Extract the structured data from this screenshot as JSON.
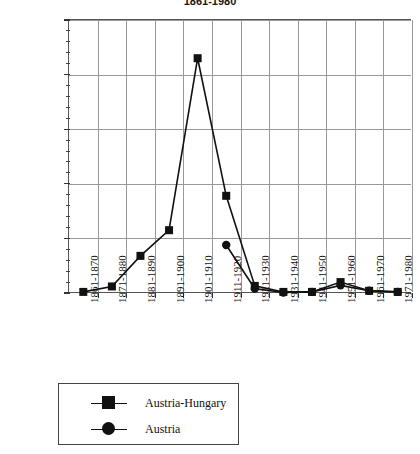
{
  "chart_data": {
    "type": "line",
    "title": "1861-1980",
    "xlabel": "",
    "ylabel": "",
    "ylim": [
      0,
      2500000
    ],
    "ytick_values": [
      0,
      500000,
      1000000,
      1500000,
      2000000,
      2500000
    ],
    "ytick_labels": [
      "0",
      "500,000",
      "1,000,000",
      "1,500,000",
      "2,000,000",
      "2,500,000"
    ],
    "yminor_step": 100000,
    "grid": true,
    "legend_position": "below",
    "categories": [
      "1861-1870",
      "1871-1880",
      "1881-1890",
      "1891-1900",
      "1901-1910",
      "1911-1920",
      "1921-1930",
      "1931-1940",
      "1941-1950",
      "1951-1960",
      "1961-1970",
      "1971-1980"
    ],
    "series": [
      {
        "name": "Austria-Hungary",
        "marker": "square",
        "color": "#111111",
        "values": [
          10000,
          60000,
          340000,
          575000,
          2150000,
          890000,
          65000,
          10000,
          10000,
          100000,
          20000,
          10000
        ]
      },
      {
        "name": "Austria",
        "marker": "circle",
        "color": "#111111",
        "values": [
          null,
          null,
          null,
          null,
          null,
          440000,
          40000,
          5000,
          10000,
          70000,
          20000,
          10000
        ]
      }
    ]
  },
  "legend": {
    "items": [
      {
        "label": "Austria-Hungary",
        "marker": "square"
      },
      {
        "label": "Austria",
        "marker": "circle"
      }
    ]
  }
}
